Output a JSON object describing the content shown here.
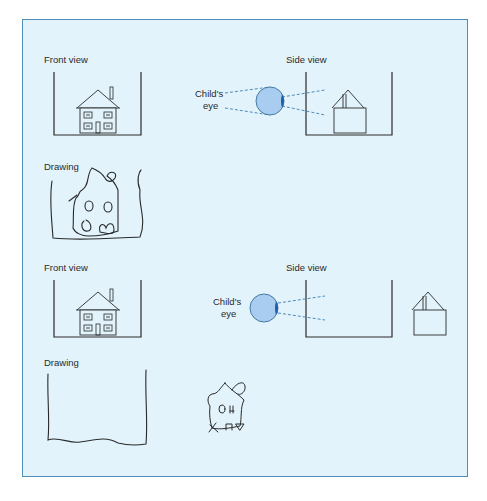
{
  "figure": {
    "background_color": "#e2f3fb",
    "border_color": "#4d8dba",
    "eye_color": "#a9cdf0",
    "pupil_color": "#1f5fa8",
    "sight_line_color": "#3f7fb0",
    "panels": [
      {
        "front_view_label": "Front view",
        "side_view_label": "Side view",
        "eye_label_line1": "Child's",
        "eye_label_line2": "eye",
        "drawing_label": "Drawing",
        "house_position": "inside container"
      },
      {
        "front_view_label": "Front view",
        "side_view_label": "Side view",
        "eye_label_line1": "Child's",
        "eye_label_line2": "eye",
        "drawing_label": "Drawing",
        "house_position": "outside container"
      }
    ]
  }
}
